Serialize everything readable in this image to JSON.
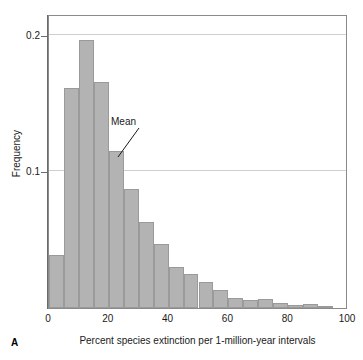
{
  "panel": {
    "letter": "A"
  },
  "chart_data": {
    "type": "bar",
    "title": "",
    "subtitle": "",
    "xlabel": "Percent species extinction per 1-million-year intervals",
    "ylabel": "Frequency",
    "xlim": [
      0,
      100
    ],
    "ylim": [
      0,
      0.215
    ],
    "grid": true,
    "legend": null,
    "bin_width": 5,
    "x_tick_labels": [
      "0",
      "20",
      "40",
      "60",
      "80",
      "100"
    ],
    "x_ticks": [
      0,
      20,
      40,
      60,
      80,
      100
    ],
    "y_tick_labels": [
      "0.1",
      "0.2"
    ],
    "y_ticks": [
      0.1,
      0.2
    ],
    "categories": [
      "0-5",
      "5-10",
      "10-15",
      "15-20",
      "20-25",
      "25-30",
      "30-35",
      "35-40",
      "40-45",
      "45-50",
      "50-55",
      "55-60",
      "60-65",
      "65-70",
      "70-75",
      "75-80",
      "80-85",
      "85-90",
      "90-95"
    ],
    "bin_starts": [
      0,
      5,
      10,
      15,
      20,
      25,
      30,
      35,
      40,
      45,
      50,
      55,
      60,
      65,
      70,
      75,
      80,
      85,
      90
    ],
    "values": [
      0.039,
      0.161,
      0.196,
      0.165,
      0.115,
      0.087,
      0.063,
      0.047,
      0.03,
      0.025,
      0.019,
      0.013,
      0.0075,
      0.006,
      0.0067,
      0.004,
      0.002,
      0.003,
      0.0015
    ],
    "bar_color": "#b3b3b3",
    "bar_edge_color": "#9a9a9a",
    "annotations": [
      {
        "label": "Mean",
        "points_to_bin": "20-25",
        "points_to_x": 22.5
      }
    ]
  }
}
